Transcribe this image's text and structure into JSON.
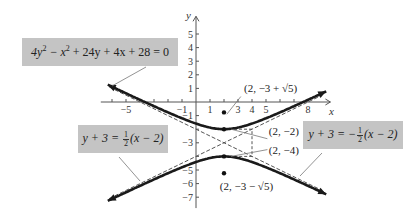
{
  "chart_data": {
    "type": "line",
    "title": "",
    "xlabel": "x",
    "ylabel": "y",
    "xlim": [
      -6.5,
      9.5
    ],
    "ylim": [
      -8,
      6
    ],
    "x_ticks": [
      -5,
      -1,
      1,
      3,
      4,
      5,
      8
    ],
    "x_minor_ticks": [
      -6,
      -5,
      -4,
      -3,
      -2,
      -1,
      1,
      2,
      3,
      4,
      5,
      6,
      7,
      8
    ],
    "y_ticks_labeled": [
      5,
      4,
      3,
      2,
      1,
      -1,
      -3,
      -5,
      -6,
      -7
    ],
    "y_minor_ticks": [
      5,
      4,
      3,
      2,
      1,
      -1,
      -2,
      -3,
      -4,
      -5,
      -6,
      -7
    ],
    "hyperbola": {
      "equation": "4y^2 - x^2 + 24y + 4x + 28 = 0",
      "standard_form": "(y+3)^2/1 - (x-2)^2/4 = 1",
      "center": [
        2,
        -3
      ],
      "a": 1,
      "b": 2,
      "orientation": "vertical"
    },
    "asymptotes": [
      {
        "name": "y + 3 = 1/2 (x - 2)",
        "slope": 0.5,
        "point": [
          2,
          -3
        ],
        "style": "dashed"
      },
      {
        "name": "y + 3 = -1/2 (x - 2)",
        "slope": -0.5,
        "point": [
          2,
          -3
        ],
        "style": "dashed"
      }
    ],
    "points": [
      {
        "label": "(2, −2)",
        "x": 2,
        "y": -2,
        "kind": "vertex"
      },
      {
        "label": "(2, −4)",
        "x": 2,
        "y": -4,
        "kind": "vertex"
      },
      {
        "label": "(2, −3 + √5)",
        "x": 2,
        "y": -0.764,
        "kind": "focus"
      },
      {
        "label": "(2, −3 − √5)",
        "x": 2,
        "y": -5.236,
        "kind": "focus"
      }
    ],
    "fundamental_rectangle": {
      "x": [
        0,
        4
      ],
      "y": [
        -4,
        -2
      ],
      "style": "dashed"
    }
  },
  "labels": {
    "equation_box": {
      "pre": "4y",
      "sup1": "2",
      "mid": " − x",
      "sup2": "2",
      "post": " + 24y + 4x + 28  = 0"
    },
    "asymptote_left_box": {
      "lhs": "y + 3 = ",
      "num": "1",
      "den": "2",
      "rhs": "(x − 2)"
    },
    "asymptote_right_box": {
      "lhs": "y + 3 = −",
      "num": "1",
      "den": "2",
      "rhs": "(x − 2)"
    }
  },
  "colors": {
    "curve": "#1a1a1a",
    "axis": "#555555",
    "dashed": "#555555",
    "box_fill": "#c4c4c4"
  }
}
